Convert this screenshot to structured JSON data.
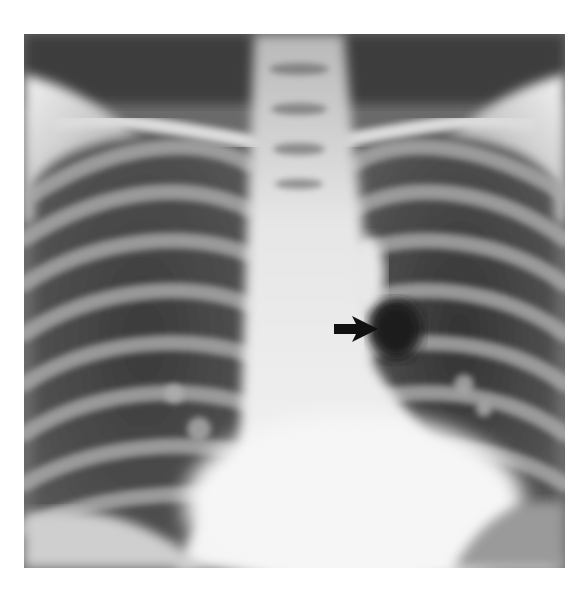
{
  "image": {
    "type": "chest radiograph (PA view)",
    "tone": "grayscale",
    "colors": {
      "background": "#ffffff",
      "lung_dark": "#2a2a2a",
      "soft_tissue": "#8a8a8a",
      "bone_bright": "#e8e8e8",
      "mediastinum": "#f0f0f0",
      "arrow": "#111111"
    }
  },
  "annotation": {
    "arrow": {
      "icon": "arrow-right-icon",
      "direction": "right",
      "position_px": {
        "x": 334,
        "y": 316,
        "width": 44,
        "height": 26
      }
    }
  }
}
